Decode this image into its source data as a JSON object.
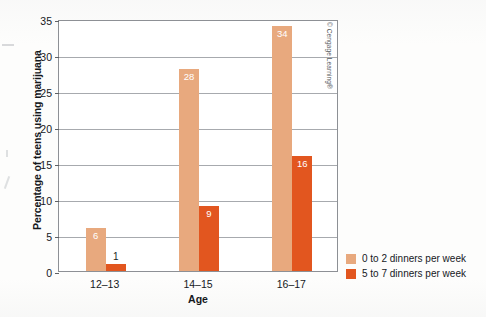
{
  "chart_data": {
    "type": "bar",
    "title": "",
    "categories": [
      "12–13",
      "14–15",
      "16–17"
    ],
    "series": [
      {
        "name": "0 to 2 dinners per week",
        "values": [
          6,
          28,
          34
        ],
        "color": "#e8a97e"
      },
      {
        "name": "5 to 7 dinners per week",
        "values": [
          1,
          9,
          16
        ],
        "color": "#e2561f"
      }
    ],
    "xlabel": "Age",
    "ylabel": "Percentage of teens using marijuana",
    "ylim": [
      0,
      35
    ],
    "yticks": [
      0,
      5,
      10,
      15,
      20,
      25,
      30,
      35
    ],
    "ytick_labels": [
      "0",
      "5",
      "10",
      "15",
      "20",
      "25",
      "30",
      "35"
    ],
    "grid": "horizontal",
    "legend_position": "outside-bottom-right",
    "data_labels": true
  },
  "legend": {
    "items": [
      {
        "label": "0 to 2 dinners per week",
        "color": "#e8a97e"
      },
      {
        "label": "5 to 7 dinners per week",
        "color": "#e2561f"
      }
    ]
  },
  "credit": {
    "text": "© Cengage Learning®"
  }
}
